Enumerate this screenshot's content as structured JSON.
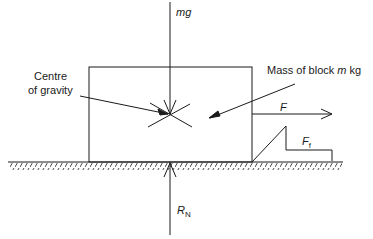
{
  "diagram": {
    "labels": {
      "weight": "mg",
      "centre_of_gravity_line1": "Centre",
      "centre_of_gravity_line2": "of gravity",
      "mass_prefix": "Mass of block ",
      "mass_var": "m",
      "mass_unit": " kg",
      "applied_force": "F",
      "friction_force": "F",
      "friction_sub": "f",
      "normal_reaction": "R",
      "normal_sub": "N"
    },
    "colors": {
      "line": "#1a1a1a",
      "background": "#ffffff"
    }
  }
}
